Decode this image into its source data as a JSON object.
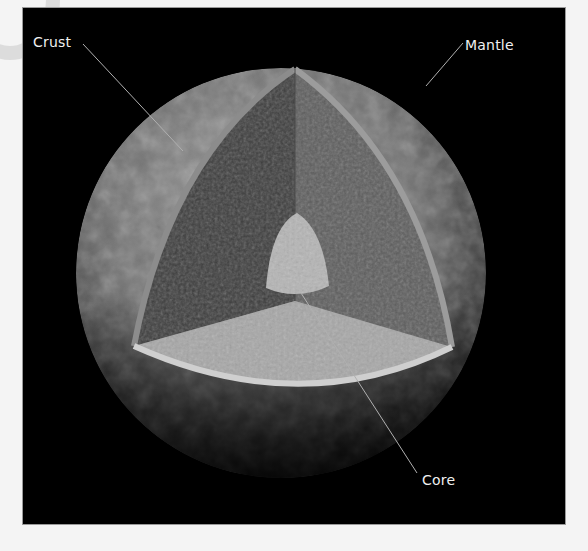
{
  "figure": {
    "labels": {
      "crust": "Crust",
      "mantle": "Mantle",
      "core": "Core"
    },
    "colors": {
      "background": "#000000",
      "page": "#f4f4f4",
      "panel_border": "#9a9a9a",
      "label_text": "#f0f0f0",
      "leader_line": "#b0b0b0",
      "surface": "#8a8a8a",
      "mantle_left_face": "#3c3c3c",
      "mantle_right_face": "#5c5c5c",
      "mantle_floor": "#a8a8a8",
      "crust_rim": "#c8c8c8",
      "core": "#b4b4b4"
    }
  }
}
